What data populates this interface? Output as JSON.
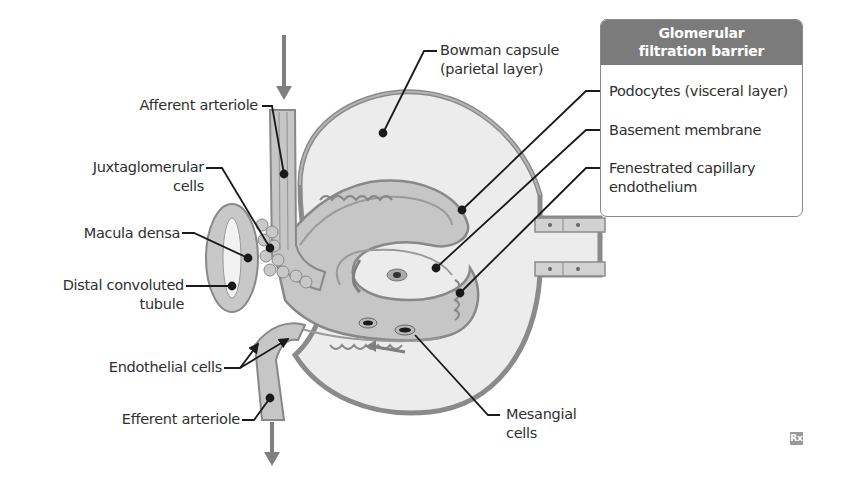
{
  "figure": {
    "colors": {
      "tissue_fill": "#c6c6c6",
      "tissue_dark": "#9a9a9a",
      "capsule_space": "#ececec",
      "outline": "#7a7a7a",
      "leader_line": "#1a1a1a",
      "flow_arrow": "#7f7f7f",
      "legend_header_bg": "#7b7b7b",
      "legend_border": "#8a8a8a"
    }
  },
  "labels": {
    "afferent_arteriole": "Afferent arteriole",
    "juxtaglomerular_cells": [
      "Juxtaglomerular",
      "cells"
    ],
    "macula_densa": "Macula densa",
    "distal_convoluted_tubule": [
      "Distal convoluted",
      "tubule"
    ],
    "endothelial_cells": "Endothelial cells",
    "efferent_arteriole": "Efferent arteriole",
    "bowman_capsule": [
      "Bowman capsule",
      "(parietal layer)"
    ],
    "mesangial_cells": [
      "Mesangial",
      "cells"
    ]
  },
  "legend": {
    "title": [
      "Glomerular",
      "filtration barrier"
    ],
    "items": [
      [
        "Podocytes (visceral layer)"
      ],
      [
        "Basement membrane"
      ],
      [
        "Fenestrated capillary",
        "endothelium"
      ]
    ]
  },
  "badge": {
    "text": "Rx",
    "icon": "rx-logo-icon"
  }
}
